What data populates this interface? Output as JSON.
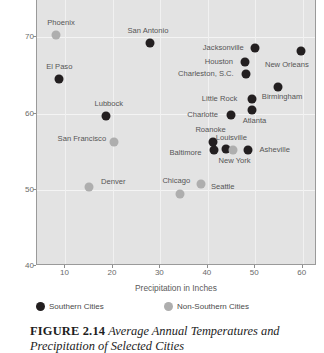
{
  "chart_data": {
    "type": "scatter",
    "title": "",
    "xlabel": "Precipitation in Inches",
    "ylabel": "Degrees Fahrenheit",
    "xlim": [
      4,
      63
    ],
    "ylim": [
      40,
      80
    ],
    "xticks": [
      10,
      20,
      30,
      40,
      50,
      60
    ],
    "yticks": [
      40,
      50,
      60,
      70
    ],
    "grid": true,
    "legend_position": "below-axis",
    "series": [
      {
        "name": "Southern Cities",
        "color": "#231f20",
        "points": [
          {
            "label": "El Paso",
            "x": 8.7,
            "y": 64.5,
            "label_dx": 0,
            "label_dy": -12
          },
          {
            "label": "Lubbock",
            "x": 18.5,
            "y": 59.7,
            "label_dx": 3,
            "label_dy": -12
          },
          {
            "label": "San Antonio",
            "x": 27.8,
            "y": 69.2,
            "label_dx": -2,
            "label_dy": -12
          },
          {
            "label": "Jacksonville",
            "x": 50.0,
            "y": 68.6,
            "label_dx": -32,
            "label_dy": 0
          },
          {
            "label": "Houston",
            "x": 47.8,
            "y": 66.8,
            "label_dx": -26,
            "label_dy": 0
          },
          {
            "label": "Charleston, S.C.",
            "x": 48.0,
            "y": 65.2,
            "label_dx": -40,
            "label_dy": 0
          },
          {
            "label": "Little Rock",
            "x": 49.2,
            "y": 61.9,
            "label_dx": -32,
            "label_dy": 0
          },
          {
            "label": "Atlanta",
            "x": 49.2,
            "y": 60.4,
            "label_dx": 3,
            "label_dy": 11
          },
          {
            "label": "Charlotte",
            "x": 44.8,
            "y": 59.8,
            "label_dx": -28,
            "label_dy": 0
          },
          {
            "label": "Birmingham",
            "x": 54.8,
            "y": 63.5,
            "label_dx": 4,
            "label_dy": 10
          },
          {
            "label": "New Orleans",
            "x": 59.6,
            "y": 68.2,
            "label_dx": -14,
            "label_dy": 14
          },
          {
            "label": "Miami",
            "x": 59.2,
            "y": 75.9,
            "label_dx": -4,
            "label_dy": -12
          },
          {
            "label": "Roanoke",
            "x": 41.0,
            "y": 56.3,
            "label_dx": -2,
            "label_dy": -12
          },
          {
            "label": "Baltimore",
            "x": 41.2,
            "y": 55.2,
            "label_dx": -28,
            "label_dy": 3
          },
          {
            "label": "Louisville",
            "x": 43.9,
            "y": 55.4,
            "label_dx": 5,
            "label_dy": -11
          },
          {
            "label": "Asheville",
            "x": 48.4,
            "y": 55.2,
            "label_dx": 27,
            "label_dy": 0
          },
          {
            "label": "",
            "x": 36.0,
            "y": 79.9,
            "label_dx": 0,
            "label_dy": 0
          }
        ]
      },
      {
        "name": "Non-Southern Cities",
        "color": "#aeaeae",
        "points": [
          {
            "label": "Phoenix",
            "x": 8.0,
            "y": 70.3,
            "label_dx": 5,
            "label_dy": -12
          },
          {
            "label": "San Francisco",
            "x": 20.2,
            "y": 56.2,
            "label_dx": -32,
            "label_dy": -3
          },
          {
            "label": "Denver",
            "x": 15.0,
            "y": 50.3,
            "label_dx": 24,
            "label_dy": -5
          },
          {
            "label": "Chicago",
            "x": 34.2,
            "y": 49.5,
            "label_dx": -4,
            "label_dy": -13
          },
          {
            "label": "Seattle",
            "x": 38.5,
            "y": 50.7,
            "label_dx": 22,
            "label_dy": 3
          },
          {
            "label": "New York",
            "x": 45.2,
            "y": 55.2,
            "label_dx": 2,
            "label_dy": 11
          }
        ]
      }
    ]
  },
  "axes": {
    "y_title": "Degrees Fahrenheit",
    "x_title": "Precipitation in Inches",
    "y_tick_labels": [
      "40",
      "50",
      "60",
      "70"
    ],
    "x_tick_labels": [
      "10",
      "20",
      "30",
      "40",
      "50",
      "60"
    ]
  },
  "legend": {
    "items": [
      {
        "label": "Southern Cities",
        "color": "#231f20"
      },
      {
        "label": "Non-Southern Cities",
        "color": "#aeaeae"
      }
    ]
  },
  "caption": {
    "figure_number": "FIGURE 2.14",
    "text": "Average Annual Temperatures and Precipitation of Selected Cities"
  }
}
